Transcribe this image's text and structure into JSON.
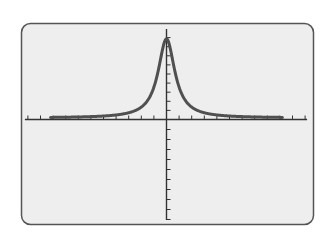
{
  "screen": {
    "background": "#eeeeee",
    "border_color": "#555555",
    "curve_color": "#505050",
    "axis_color": "#333333"
  },
  "chart_data": {
    "type": "line",
    "title": "",
    "xlabel": "",
    "ylabel": "",
    "grid": false,
    "legend": null,
    "xlim": [
      -11,
      11
    ],
    "ylim": [
      -10,
      9
    ],
    "x_ticks_per_side": 11,
    "y_ticks_above": 9,
    "y_ticks_below": 10,
    "series": [
      {
        "name": "f(x)",
        "peak": {
          "x": 0,
          "y": 8.7
        },
        "half_width": 0.8,
        "x": [
          -10,
          -8,
          -6,
          -4,
          -3,
          -2,
          -1.5,
          -1,
          -0.5,
          0,
          0.5,
          1,
          1.5,
          2,
          3,
          4,
          6,
          8,
          10
        ],
        "y": [
          0.1,
          0.15,
          0.25,
          0.55,
          0.95,
          1.9,
          3.0,
          4.6,
          7.1,
          8.7,
          7.1,
          4.6,
          3.0,
          1.9,
          0.95,
          0.55,
          0.25,
          0.15,
          0.1
        ]
      }
    ]
  }
}
